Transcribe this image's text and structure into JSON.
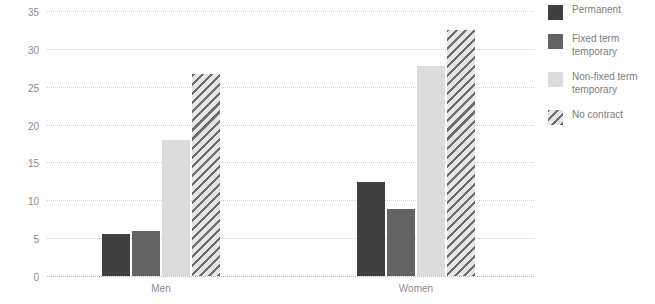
{
  "chart_data": {
    "type": "bar",
    "title": "",
    "xlabel": "",
    "ylabel": "Percent",
    "categories": [
      "Men",
      "Women"
    ],
    "series": [
      {
        "name": "Permanent",
        "values": [
          5.6,
          12.4
        ],
        "color": "#3f3f3f",
        "pattern": "solid"
      },
      {
        "name": "Fixed term\ntemporary",
        "values": [
          6.0,
          8.9
        ],
        "color": "#636363",
        "pattern": "solid"
      },
      {
        "name": "Non-fixed term\ntemporary",
        "values": [
          17.9,
          27.7
        ],
        "color": "#dcdcdc",
        "pattern": "solid"
      },
      {
        "name": "No contract",
        "values": [
          26.7,
          32.5
        ],
        "color": "#d4d4d4",
        "pattern": "diagonal-hatch"
      }
    ],
    "ylim": [
      0,
      35
    ],
    "yticks": [
      0,
      5,
      10,
      15,
      20,
      25,
      30,
      35
    ],
    "ytick_labels": [
      "0",
      "5",
      "10",
      "15",
      "20",
      "25",
      "30",
      "35"
    ],
    "grid": true,
    "grid_style": "dotted-horizontal",
    "legend_position": "right"
  }
}
